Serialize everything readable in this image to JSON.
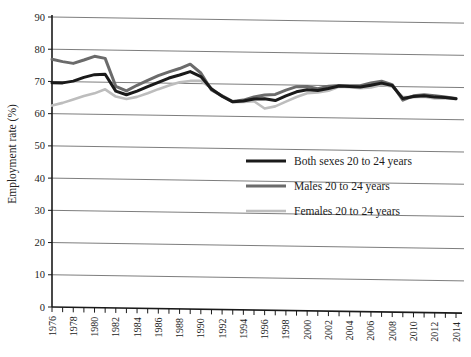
{
  "chart_data": {
    "type": "line",
    "title": "",
    "xlabel": "",
    "ylabel": "Employment rate (%)",
    "ylim": [
      0,
      90
    ],
    "xlim": [
      1976,
      2014
    ],
    "ytick_step": 10,
    "yticks": [
      "0",
      "10",
      "20",
      "30",
      "40",
      "50",
      "60",
      "70",
      "80",
      "90"
    ],
    "grid": true,
    "legend_position": "center",
    "xticks": [
      "1976",
      "1978",
      "1980",
      "1982",
      "1984",
      "1986",
      "1988",
      "1990",
      "1992",
      "1994",
      "1996",
      "1998",
      "2000",
      "2002",
      "2004",
      "2006",
      "2008",
      "2010",
      "2012",
      "2014"
    ],
    "x": [
      1976,
      1977,
      1978,
      1979,
      1980,
      1981,
      1982,
      1983,
      1984,
      1985,
      1986,
      1987,
      1988,
      1989,
      1990,
      1991,
      1992,
      1993,
      1994,
      1995,
      1996,
      1997,
      1998,
      1999,
      2000,
      2001,
      2002,
      2003,
      2004,
      2005,
      2006,
      2007,
      2008,
      2009,
      2010,
      2011,
      2012,
      2013,
      2014
    ],
    "series": [
      {
        "name": "Both sexes 20 to 24 years",
        "color": "#1a1a1a",
        "width": 3.0,
        "values": [
          69.6,
          69.6,
          70.2,
          71.4,
          72.3,
          72.5,
          67.3,
          66.2,
          67.4,
          68.8,
          70.2,
          71.6,
          72.6,
          73.7,
          72.2,
          68.4,
          66.2,
          64.5,
          64.8,
          65.5,
          65.6,
          65.1,
          66.6,
          67.9,
          68.6,
          68.4,
          69.1,
          69.9,
          69.8,
          69.7,
          70.3,
          71.0,
          70.3,
          66.3,
          67.0,
          67.3,
          66.9,
          66.8,
          66.5
        ]
      },
      {
        "name": "Males 20 to 24 years",
        "color": "#6b6b6b",
        "width": 3.0,
        "values": [
          76.9,
          76.2,
          75.7,
          76.8,
          78.0,
          77.4,
          68.8,
          67.4,
          69.2,
          70.8,
          72.3,
          73.5,
          74.6,
          76.0,
          73.3,
          68.1,
          66.3,
          64.6,
          65.1,
          66.1,
          66.8,
          67.0,
          68.4,
          69.5,
          69.6,
          69.0,
          69.8,
          70.1,
          70.0,
          70.1,
          71.0,
          71.6,
          70.6,
          65.8,
          67.2,
          67.6,
          67.3,
          67.0,
          66.6
        ]
      },
      {
        "name": "Females 20 to 24 years",
        "color": "#bdbdbd",
        "width": 2.6,
        "values": [
          62.5,
          63.4,
          64.5,
          65.6,
          66.5,
          67.8,
          65.6,
          64.9,
          65.6,
          66.8,
          68.1,
          69.3,
          70.3,
          70.8,
          70.9,
          68.6,
          66.1,
          64.4,
          64.5,
          64.8,
          62.6,
          63.3,
          64.8,
          66.3,
          67.5,
          67.8,
          68.4,
          69.7,
          69.6,
          69.3,
          69.6,
          70.4,
          70.0,
          66.8,
          66.8,
          67.0,
          66.5,
          66.5,
          66.4
        ]
      }
    ],
    "legend": [
      {
        "label": "Both sexes 20 to 24 years",
        "color": "#1a1a1a"
      },
      {
        "label": "Males 20 to 24 years",
        "color": "#6b6b6b"
      },
      {
        "label": "Females 20 to 24 years",
        "color": "#bdbdbd"
      }
    ]
  }
}
